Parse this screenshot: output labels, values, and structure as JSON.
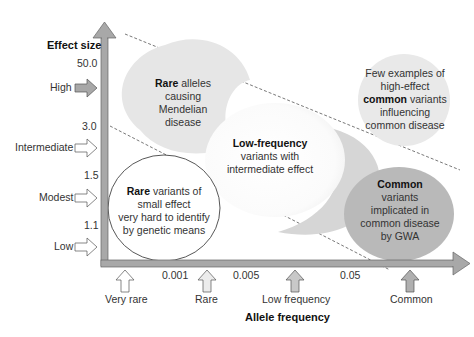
{
  "diagram": {
    "y_axis": {
      "title": "Effect size",
      "ticks": [
        "50.0",
        "3.0",
        "1.5",
        "1.1"
      ],
      "categories": [
        "High",
        "Intermediate",
        "Modest",
        "Low"
      ]
    },
    "x_axis": {
      "title": "Allele frequency",
      "ticks": [
        "0.001",
        "0.005",
        "0.05"
      ],
      "categories": [
        "Very rare",
        "Rare",
        "Low frequency",
        "Common"
      ]
    },
    "regions": {
      "mendelian": {
        "bold": "Rare",
        "line1": " alleles",
        "line2": "causing",
        "line3": "Mendelian",
        "line4": "disease"
      },
      "few_common": {
        "line1": "Few examples of",
        "line2": "high-effect",
        "bold": "common",
        "line3_rest": " variants",
        "line4": "influencing",
        "line5": "common disease"
      },
      "low_frequency": {
        "bold": "Low-frequency",
        "line2": "variants with",
        "line3": "intermediate effect"
      },
      "rare_small": {
        "bold": "Rare",
        "line1_rest": " variants of",
        "line2": "small effect",
        "line3": "very hard to identify",
        "line4": "by genetic means"
      },
      "common_gwa": {
        "bold": "Common",
        "line2": "variants",
        "line3": "implicated in",
        "line4": "common disease",
        "line5": "by GWA"
      }
    },
    "colors": {
      "axis": "#a8a8a8",
      "axis_stroke": "#666666",
      "mendelian_fill": "#e6e6e6",
      "few_common_fill": "#e9e9e9",
      "crescent_fill": "#d8d8d8",
      "common_fill": "#b9b9b9",
      "arrow_filled": "#b0b0b0",
      "arrow_outline": "#ffffff"
    }
  }
}
